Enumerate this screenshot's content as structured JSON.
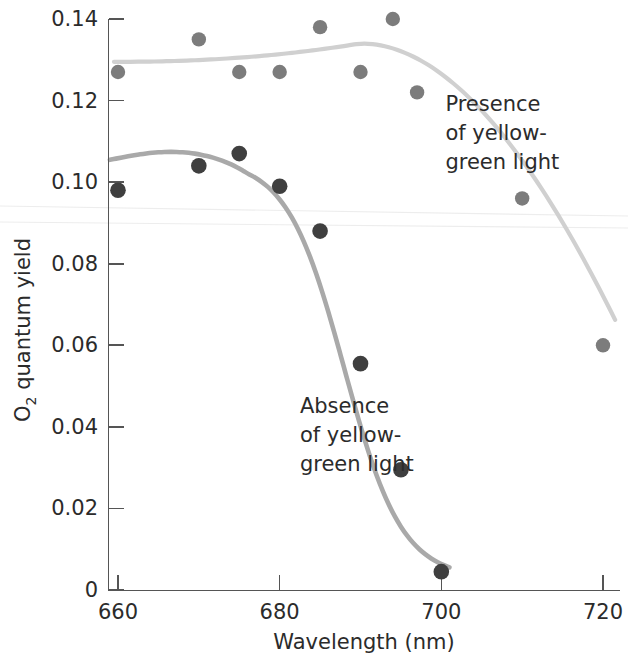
{
  "chart_data": {
    "type": "scatter",
    "title": "",
    "xlabel": "Wavelength (nm)",
    "ylabel": "O2 quantum yield",
    "ylabel_base": "O",
    "ylabel_sub": "2",
    "ylabel_rest": " quantum yield",
    "xlim": [
      655,
      723
    ],
    "ylim": [
      0,
      0.145
    ],
    "xticks": [
      660,
      680,
      700,
      720
    ],
    "xtick_labels": [
      "660",
      "680",
      "700",
      "720"
    ],
    "yticks": [
      0,
      0.02,
      0.04,
      0.06,
      0.08,
      0.1,
      0.12,
      0.14
    ],
    "ytick_labels": [
      "0",
      "0.02",
      "0.04",
      "0.06",
      "0.08",
      "0.10",
      "0.12",
      "0.14"
    ],
    "grid": false,
    "legend_position": "inline-annotations",
    "series": [
      {
        "name": "Presence of yellow-green light",
        "marker_color": "#7c7c7c",
        "line_color": "#d0d0d0",
        "x": [
          660,
          670,
          675,
          680,
          685,
          690,
          694,
          697,
          710,
          720
        ],
        "y": [
          0.127,
          0.135,
          0.127,
          0.127,
          0.138,
          0.127,
          0.14,
          0.122,
          0.096,
          0.06
        ]
      },
      {
        "name": "Absence of yellow-green light",
        "marker_color": "#3f3f3f",
        "line_color": "#a9a9a9",
        "x": [
          660,
          670,
          675,
          680,
          685,
          690,
          695,
          700
        ],
        "y": [
          0.098,
          0.104,
          0.107,
          0.099,
          0.088,
          0.0555,
          0.0295,
          0.0045
        ]
      }
    ],
    "annotations": [
      {
        "id": "presence-label",
        "lines": [
          "Presence",
          "of yellow-",
          "green light"
        ],
        "x": 700.5,
        "y": 0.1175
      },
      {
        "id": "absence-label",
        "lines": [
          "Absence",
          "of yellow-",
          "green light"
        ],
        "x": 682.5,
        "y": 0.0435
      }
    ]
  },
  "axes": {
    "x_title": "Wavelength (nm)",
    "y_title_base": "O",
    "y_title_sub": "2",
    "y_title_rest": " quantum yield"
  },
  "colors": {
    "axis": "#555555",
    "text": "#2b2b2b",
    "upper_marker": "#7c7c7c",
    "upper_line": "#d0d0d0",
    "lower_marker": "#3f3f3f",
    "lower_line": "#a9a9a9",
    "background": "#ffffff"
  }
}
